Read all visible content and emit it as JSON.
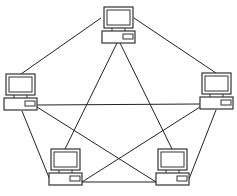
{
  "diagram": {
    "type": "mesh-network-topology",
    "node_icon": "desktop-computer-icon",
    "line_color": "#222222",
    "nodes": [
      {
        "id": "top",
        "name": "computer-top"
      },
      {
        "id": "left",
        "name": "computer-left"
      },
      {
        "id": "right",
        "name": "computer-right"
      },
      {
        "id": "bottom-left",
        "name": "computer-bottom-left"
      },
      {
        "id": "bottom-right",
        "name": "computer-bottom-right"
      }
    ],
    "links": [
      {
        "from": "top",
        "to": "left"
      },
      {
        "from": "top",
        "to": "right"
      },
      {
        "from": "top",
        "to": "bottom-left"
      },
      {
        "from": "top",
        "to": "bottom-right"
      },
      {
        "from": "left",
        "to": "right"
      },
      {
        "from": "left",
        "to": "bottom-left"
      },
      {
        "from": "left",
        "to": "bottom-right"
      },
      {
        "from": "right",
        "to": "bottom-left"
      },
      {
        "from": "right",
        "to": "bottom-right"
      },
      {
        "from": "bottom-left",
        "to": "bottom-right"
      }
    ]
  }
}
